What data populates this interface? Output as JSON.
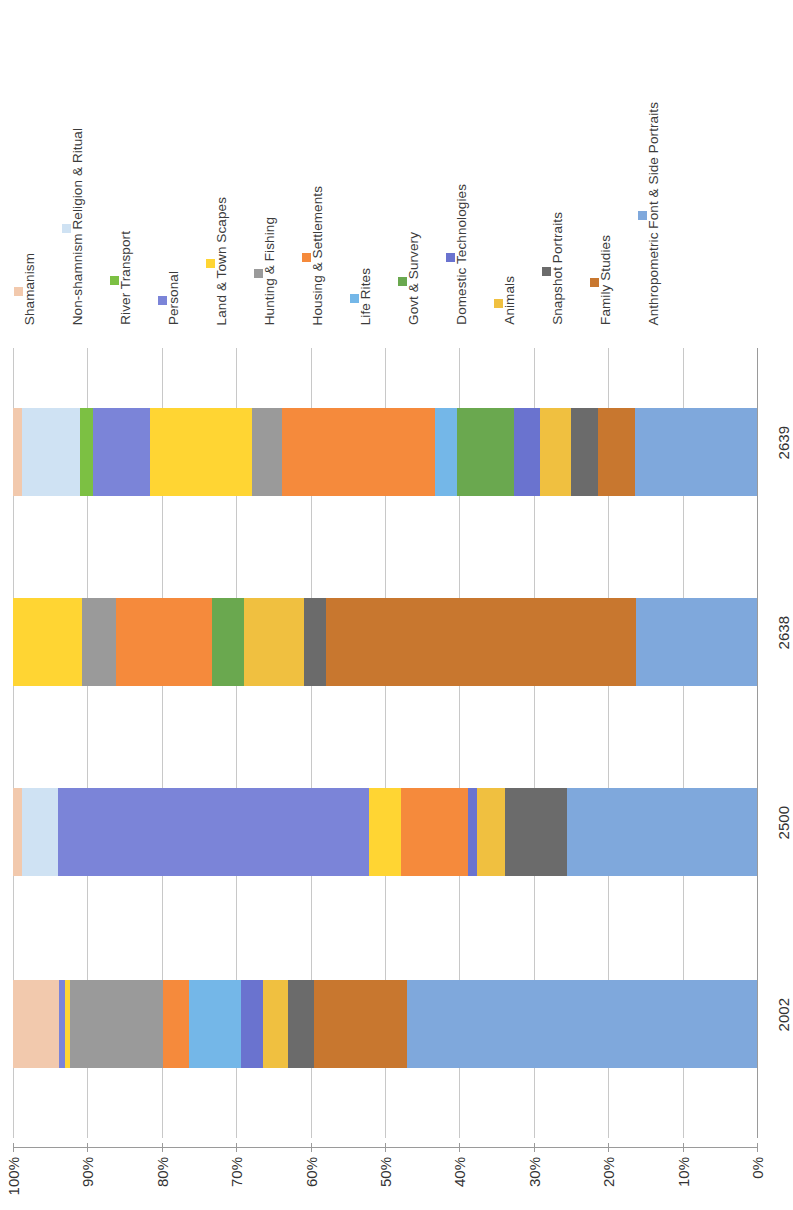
{
  "chart_data": {
    "type": "bar",
    "orientation": "stacked-horizontal-rotated",
    "title": "",
    "subtitle": "",
    "xlabel": "",
    "ylabel": "",
    "grid": true,
    "legend_position": "top",
    "axis_direction": "100% at left to 0% at right",
    "ylim": [
      0,
      100
    ],
    "tick_labels": [
      "100%",
      "90%",
      "80%",
      "70%",
      "60%",
      "50%",
      "40%",
      "30%",
      "20%",
      "10%",
      "0%"
    ],
    "categories": [
      "2639",
      "2638",
      "2500",
      "2002"
    ],
    "series": [
      {
        "name": "Shamanism",
        "color": "#f2c9ad",
        "values": [
          1.2,
          0.0,
          1.2,
          6.2
        ]
      },
      {
        "name": "Non-shamnism Religion & Ritual",
        "color": "#cfe2f3",
        "values": [
          7.8,
          0.0,
          4.8,
          0.0
        ]
      },
      {
        "name": "River Transport",
        "color": "#7cc043",
        "values": [
          1.7,
          0.0,
          0.0,
          0.0
        ]
      },
      {
        "name": "Personal",
        "color": "#7b84d8",
        "values": [
          7.7,
          0.0,
          41.9,
          0.8
        ]
      },
      {
        "name": "Land & Town Scapes",
        "color": "#ffd533",
        "values": [
          13.7,
          9.3,
          4.3,
          0.7
        ]
      },
      {
        "name": "Hunting & Fishing",
        "color": "#9a9a9a",
        "values": [
          4.0,
          4.6,
          0.0,
          12.4
        ]
      },
      {
        "name": "Housing & Settlements",
        "color": "#f58a3c",
        "values": [
          20.6,
          12.9,
          9.0,
          3.6
        ]
      },
      {
        "name": "Life Rites",
        "color": "#74b7e8",
        "values": [
          3.0,
          0.0,
          0.0,
          6.9
        ]
      },
      {
        "name": "Govt & Survery",
        "color": "#6aa84f",
        "values": [
          7.7,
          4.2,
          0.0,
          0.0
        ]
      },
      {
        "name": "Domestic Technologies",
        "color": "#6a73cf",
        "values": [
          3.4,
          0.0,
          1.2,
          3.0
        ]
      },
      {
        "name": "Animals",
        "color": "#f0c040",
        "values": [
          4.2,
          8.1,
          3.8,
          3.4
        ]
      },
      {
        "name": "Snapshot Portraits",
        "color": "#6b6b6b",
        "values": [
          3.6,
          3.0,
          8.3,
          3.4
        ]
      },
      {
        "name": "Family Studies",
        "color": "#c8772f",
        "values": [
          5.0,
          41.7,
          0.0,
          12.5
        ]
      },
      {
        "name": "Anthropometric Font & Side Portraits",
        "color": "#7fa8dc",
        "values": [
          16.4,
          16.2,
          25.5,
          47.1
        ]
      }
    ]
  }
}
